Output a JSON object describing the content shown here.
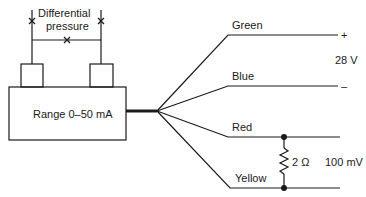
{
  "diagram": {
    "pressure_label_line1": "Differential",
    "pressure_label_line2": "pressure",
    "transmitter_label": "Range 0–50 mA",
    "wires": {
      "green": "Green",
      "blue": "Blue",
      "red": "Red",
      "yellow": "Yellow"
    },
    "supply": {
      "plus": "+",
      "minus": "–",
      "voltage": "28 V"
    },
    "resistor": {
      "value": "2 Ω",
      "output": "100 mV"
    },
    "colors": {
      "line": "#1a1a1a",
      "background": "#ffffff"
    }
  }
}
